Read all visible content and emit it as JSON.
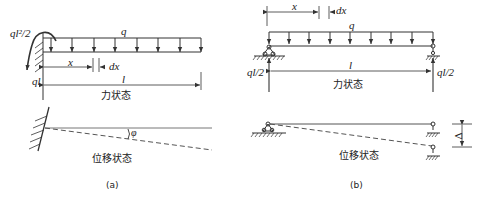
{
  "figure_a": {
    "caption": "(a)",
    "force_state_label": "力状态",
    "displacement_state_label": "位移状态",
    "moment_label": "ql²/2",
    "reaction_label": "ql",
    "load_label": "q",
    "x_label": "x",
    "dx_label": "dx",
    "length_label": "l",
    "rotation_label": "φ"
  },
  "figure_b": {
    "caption": "(b)",
    "force_state_label": "力状态",
    "displacement_state_label": "位移状态",
    "left_reaction_label": "ql/2",
    "right_reaction_label": "ql/2",
    "load_label": "q",
    "x_label": "x",
    "dx_label": "dx",
    "length_label": "l",
    "settlement_label": "Δ"
  },
  "colors": {
    "line": "#333333",
    "dashed": "#555555"
  }
}
